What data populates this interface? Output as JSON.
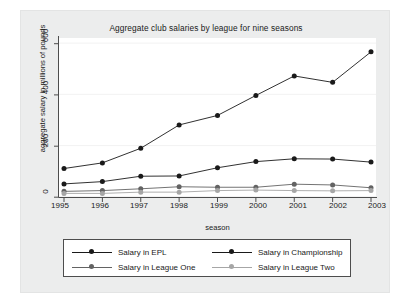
{
  "chart_data": {
    "type": "line",
    "title": "Aggregate club salaries by league for nine seasons",
    "xlabel": "season",
    "ylabel": "aggregate salary in millions of pounds",
    "x": [
      1995,
      1996,
      1997,
      1998,
      1999,
      2000,
      2001,
      2002,
      2003
    ],
    "xtick_labels": [
      "1995",
      "1996",
      "1997",
      "1998",
      "1999",
      "2000",
      "2001",
      "2002",
      "2003"
    ],
    "ytick_labels": [
      "0",
      "200",
      "400",
      "600"
    ],
    "yticks": [
      0,
      200,
      400,
      600
    ],
    "ylim": [
      0,
      620
    ],
    "xlim": [
      1995,
      2003
    ],
    "grid": true,
    "legend_position": "bottom",
    "series": [
      {
        "name": "Salary in EPL",
        "color": "#1a1a1a",
        "marker": "circle",
        "values": [
          111,
          133,
          190,
          281,
          318,
          396,
          472,
          447,
          566
        ]
      },
      {
        "name": "Salary in Championship",
        "color": "#1a1a1a",
        "marker": "circle",
        "values": [
          51,
          60,
          81,
          82,
          114,
          138,
          149,
          148,
          136
        ]
      },
      {
        "name": "Salary in League One",
        "color": "#636363",
        "marker": "circle",
        "values": [
          22,
          25,
          32,
          40,
          38,
          38,
          50,
          47,
          36
        ]
      },
      {
        "name": "Salary in League Two",
        "color": "#a6a6a6",
        "marker": "circle",
        "values": [
          14,
          14,
          19,
          19,
          25,
          27,
          25,
          24,
          25
        ]
      }
    ]
  },
  "legend": {
    "entries": [
      {
        "label": "Salary in EPL"
      },
      {
        "label": "Salary in Championship"
      },
      {
        "label": "Salary in League One"
      },
      {
        "label": "Salary in League Two"
      }
    ]
  },
  "colors": {
    "plot_background": "#ffffff",
    "graph_background": "#eceded",
    "axis": "#4d4d4d",
    "grid": "#f2f2f2",
    "text": "#1a1a1a"
  }
}
